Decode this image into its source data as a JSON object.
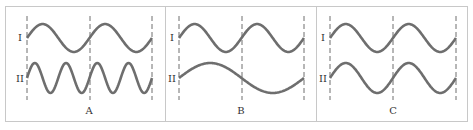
{
  "figure": {
    "type": "wave-comparison-diagram",
    "panels": [
      {
        "id": "A",
        "label": "A",
        "waves": [
          {
            "label": "I",
            "periods_between_dashes": 1
          },
          {
            "label": "II",
            "periods_between_dashes": 2
          }
        ]
      },
      {
        "id": "B",
        "label": "B",
        "waves": [
          {
            "label": "I",
            "periods_between_dashes": 1
          },
          {
            "label": "II",
            "periods_between_dashes": 0.5
          }
        ]
      },
      {
        "id": "C",
        "label": "C",
        "waves": [
          {
            "label": "I",
            "periods_between_dashes": 1
          },
          {
            "label": "II",
            "periods_between_dashes": 1
          }
        ]
      }
    ],
    "colors": {
      "wave": "#6e6e6e",
      "dash": "#6e6e6e",
      "border": "#c8c8c8",
      "text": "#333333"
    }
  }
}
